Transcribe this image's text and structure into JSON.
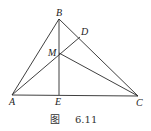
{
  "figure": {
    "caption_prefix": "图",
    "caption_number": "6.11",
    "points": {
      "A": {
        "label": "A",
        "x": 12,
        "y": 95
      },
      "B": {
        "label": "B",
        "x": 59,
        "y": 19
      },
      "C": {
        "label": "C",
        "x": 138,
        "y": 96
      },
      "D": {
        "label": "D",
        "x": 80,
        "y": 37
      },
      "E": {
        "label": "E",
        "x": 59,
        "y": 95
      },
      "M": {
        "label": "M",
        "x": 59,
        "y": 53
      }
    },
    "segments": [
      "AB",
      "BC",
      "AC",
      "BE",
      "AD",
      "MC"
    ],
    "line_color": "#2a2a2a"
  }
}
